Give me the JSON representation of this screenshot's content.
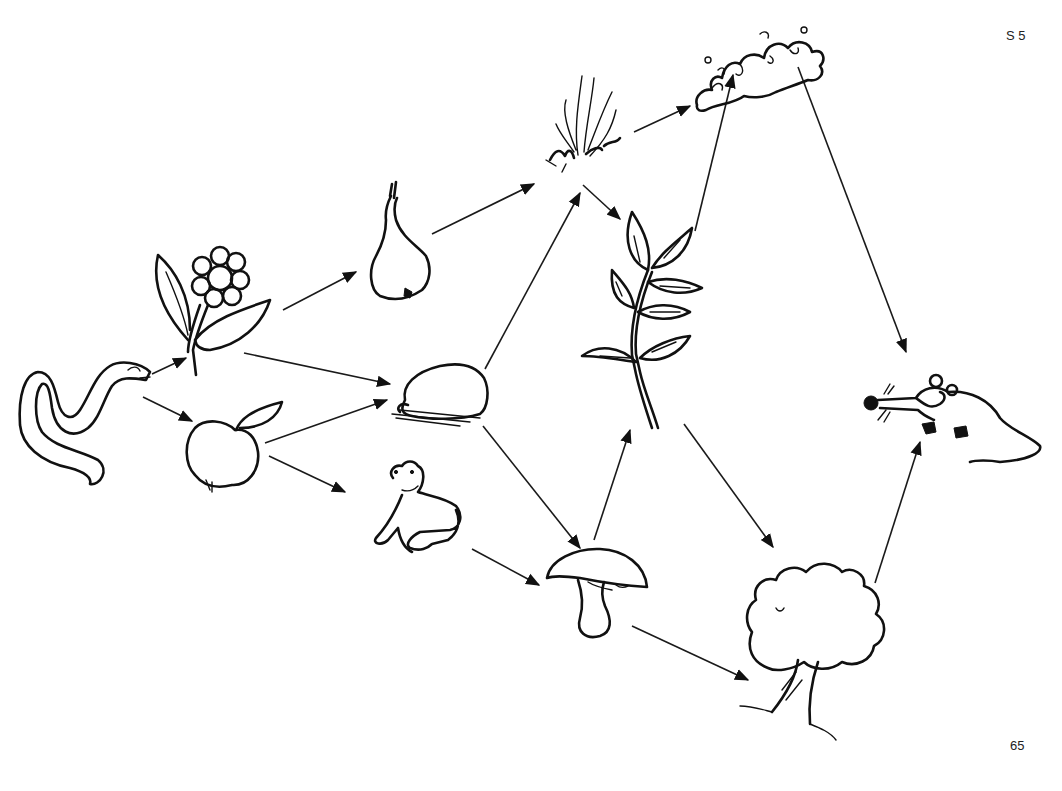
{
  "page": {
    "code": "S 5",
    "number": "65",
    "background": "#ffffff",
    "ink_color": "#111111"
  },
  "nodes": [
    {
      "id": "snake",
      "label": "snake",
      "x": 80,
      "y": 420
    },
    {
      "id": "flower",
      "label": "flower",
      "x": 210,
      "y": 300
    },
    {
      "id": "apple",
      "label": "apple",
      "x": 222,
      "y": 445
    },
    {
      "id": "pear",
      "label": "pear",
      "x": 400,
      "y": 240
    },
    {
      "id": "stone",
      "label": "stone",
      "x": 435,
      "y": 400
    },
    {
      "id": "frog",
      "label": "frog",
      "x": 420,
      "y": 515
    },
    {
      "id": "grass",
      "label": "grass tuft",
      "x": 590,
      "y": 120
    },
    {
      "id": "cloud",
      "label": "cloud / bush",
      "x": 755,
      "y": 60
    },
    {
      "id": "branch",
      "label": "leafy branch",
      "x": 640,
      "y": 310
    },
    {
      "id": "mushroom",
      "label": "mushroom",
      "x": 597,
      "y": 590
    },
    {
      "id": "tree",
      "label": "tree",
      "x": 815,
      "y": 640
    },
    {
      "id": "mouse",
      "label": "mouse",
      "x": 950,
      "y": 410
    }
  ],
  "arrows": [
    {
      "from": "snake",
      "to": "flower",
      "x1": 152,
      "y1": 374,
      "x2": 186,
      "y2": 358
    },
    {
      "from": "snake",
      "to": "apple",
      "x1": 143,
      "y1": 397,
      "x2": 192,
      "y2": 421
    },
    {
      "from": "flower",
      "to": "pear",
      "x1": 283,
      "y1": 310,
      "x2": 356,
      "y2": 272
    },
    {
      "from": "flower",
      "to": "stone",
      "x1": 244,
      "y1": 353,
      "x2": 390,
      "y2": 384
    },
    {
      "from": "apple",
      "to": "stone",
      "x1": 265,
      "y1": 443,
      "x2": 387,
      "y2": 400
    },
    {
      "from": "apple",
      "to": "frog",
      "x1": 269,
      "y1": 456,
      "x2": 345,
      "y2": 492
    },
    {
      "from": "pear",
      "to": "grass",
      "x1": 432,
      "y1": 234,
      "x2": 534,
      "y2": 184
    },
    {
      "from": "stone",
      "to": "grass",
      "x1": 485,
      "y1": 369,
      "x2": 580,
      "y2": 193
    },
    {
      "from": "grass",
      "to": "branch",
      "x1": 583,
      "y1": 185,
      "x2": 620,
      "y2": 219
    },
    {
      "from": "grass",
      "to": "cloud",
      "x1": 634,
      "y1": 132,
      "x2": 690,
      "y2": 106
    },
    {
      "from": "branch",
      "to": "cloud",
      "x1": 695,
      "y1": 231,
      "x2": 733,
      "y2": 75
    },
    {
      "from": "stone",
      "to": "mushroom",
      "x1": 483,
      "y1": 426,
      "x2": 580,
      "y2": 548
    },
    {
      "from": "mushroom",
      "to": "branch",
      "x1": 594,
      "y1": 540,
      "x2": 630,
      "y2": 430
    },
    {
      "from": "frog",
      "to": "mushroom",
      "x1": 472,
      "y1": 549,
      "x2": 539,
      "y2": 585
    },
    {
      "from": "branch",
      "to": "tree",
      "x1": 684,
      "y1": 424,
      "x2": 773,
      "y2": 547
    },
    {
      "from": "mushroom",
      "to": "tree",
      "x1": 632,
      "y1": 626,
      "x2": 748,
      "y2": 680
    },
    {
      "from": "cloud",
      "to": "mouse",
      "x1": 798,
      "y1": 67,
      "x2": 906,
      "y2": 352
    },
    {
      "from": "tree",
      "to": "mouse",
      "x1": 875,
      "y1": 583,
      "x2": 920,
      "y2": 442
    }
  ]
}
